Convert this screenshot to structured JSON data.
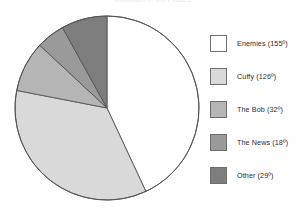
{
  "figure": {
    "clipped_top_caption": "proportion of story pages",
    "background_color": "#ffffff"
  },
  "legend": {
    "position": "right",
    "items": [
      {
        "label": "Enemies (155º)",
        "swatch_name": "legend-swatch-enemies",
        "color": "#ffffff"
      },
      {
        "label": "Cuffy (126º)",
        "swatch_name": "legend-swatch-cuffy",
        "color": "#d9d9d9"
      },
      {
        "label": "The Bob (32º)",
        "swatch_name": "legend-swatch-the-bob",
        "color": "#b5b5b5"
      },
      {
        "label": "The News (18º)",
        "swatch_name": "legend-swatch-the-news",
        "color": "#9a9a9a"
      },
      {
        "label": "Other (29º)",
        "swatch_name": "legend-swatch-other",
        "color": "#7d7d7d"
      }
    ]
  },
  "chart_data": {
    "type": "pie",
    "title": "",
    "subtitle": "",
    "xlabel": "",
    "ylabel": "",
    "grid": false,
    "legend_position": "right",
    "units": "degrees",
    "total_degrees": 360,
    "start_angle_deg": 0,
    "direction": "clockwise",
    "labels": [
      "Enemies",
      "Cuffy",
      "The Bob",
      "The News",
      "Other"
    ],
    "values_deg": [
      155,
      126,
      32,
      18,
      29
    ],
    "values_percent": [
      43.1,
      35.0,
      8.9,
      5.0,
      8.1
    ],
    "data_labels": [
      "Enemies (155º)",
      "Cuffy (126º)",
      "The Bob (32º)",
      "The News (18º)",
      "Other (29º)"
    ],
    "colors": [
      "#ffffff",
      "#d9d9d9",
      "#b5b5b5",
      "#9a9a9a",
      "#7d7d7d"
    ],
    "slice_border_color": "#555555",
    "annotations": []
  }
}
